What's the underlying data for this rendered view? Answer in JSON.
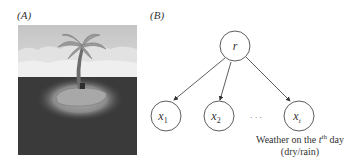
{
  "panels": {
    "a": {
      "label": "(A)",
      "image": {
        "subject": "palm-tree-island-illustration",
        "colors": {
          "sky": "#cfcfcf",
          "cloud": "#ececec",
          "sea": "#3c3c3c",
          "sand": "#b8b8b8",
          "glow": "#8a8a8a",
          "trunk": "#6a6a6a",
          "leaves": "#9a9a9a"
        }
      }
    },
    "b": {
      "label": "(B)",
      "nodes": {
        "root": {
          "label": "r"
        },
        "x1": {
          "label": "x",
          "sub": "1"
        },
        "x2": {
          "label": "x",
          "sub": "2"
        },
        "ellipsis": "· · ·",
        "xt": {
          "label": "x",
          "sub": "t"
        }
      },
      "caption": {
        "line1_prefix": "Weather on the ",
        "line1_var": "t",
        "line1_sup": "th",
        "line1_suffix": " day",
        "line2": "(dry/rain)"
      },
      "edges": [
        [
          "r",
          "x1"
        ],
        [
          "r",
          "x2"
        ],
        [
          "r",
          "xt"
        ]
      ]
    }
  }
}
